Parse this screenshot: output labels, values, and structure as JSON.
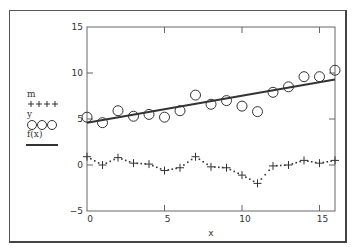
{
  "chart_data": {
    "type": "scatter",
    "title": "",
    "xlabel": "x",
    "ylabel": "",
    "xlim": [
      0,
      16
    ],
    "ylim": [
      -5,
      15
    ],
    "xticks": [
      0,
      5,
      10,
      15
    ],
    "yticks": [
      -5,
      0,
      5,
      10,
      15
    ],
    "grid": false,
    "legend_position": "left",
    "x": [
      0,
      1,
      2,
      3,
      4,
      5,
      6,
      7,
      8,
      9,
      10,
      11,
      12,
      13,
      14,
      15,
      16
    ],
    "series": [
      {
        "name": "m",
        "style": "dotted line with plus markers",
        "values": [
          0.9,
          0.0,
          0.8,
          0.2,
          0.1,
          -0.6,
          -0.3,
          0.9,
          -0.2,
          -0.3,
          -1.1,
          -2.0,
          -0.1,
          0.0,
          0.5,
          0.2,
          0.5
        ]
      },
      {
        "name": "y",
        "style": "open circle markers",
        "values": [
          5.2,
          4.6,
          5.9,
          5.3,
          5.5,
          5.2,
          5.9,
          7.6,
          6.6,
          7.0,
          6.4,
          5.8,
          7.9,
          8.5,
          9.6,
          9.6,
          10.3
        ]
      },
      {
        "name": "f(x)",
        "style": "solid line",
        "values": [
          4.6,
          9.3
        ],
        "x": [
          0,
          16
        ]
      }
    ]
  },
  "legend": {
    "items": [
      {
        "label": "m",
        "symbol": "plus-dotted"
      },
      {
        "label": "y",
        "symbol": "circles"
      },
      {
        "label": "f(x)",
        "symbol": "solid-line"
      }
    ]
  },
  "axis": {
    "x_label": "x",
    "x_tick_labels": [
      "0",
      "5",
      "10",
      "15"
    ],
    "y_tick_labels": [
      "-5",
      "0",
      "5",
      "10",
      "15"
    ]
  },
  "colors": {
    "frame": "#555555",
    "axis": "#666666",
    "series": "#333333"
  }
}
